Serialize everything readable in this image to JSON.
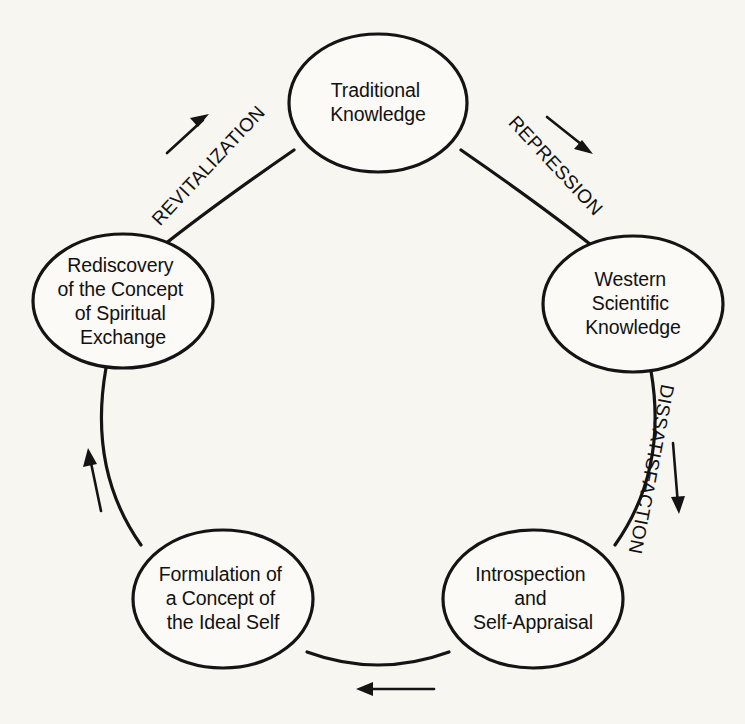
{
  "diagram": {
    "type": "cycle",
    "background_color": "#f7f6f1",
    "line_color": "#141414",
    "nodes": [
      {
        "id": "traditional-knowledge",
        "position": "top",
        "cx": 378,
        "cy": 103,
        "rx": 89,
        "ry": 69,
        "lines": [
          "Traditional",
          "Knowledge"
        ]
      },
      {
        "id": "western-scientific-knowledge",
        "position": "right",
        "cx": 633,
        "cy": 304,
        "rx": 90,
        "ry": 68,
        "lines": [
          "Western",
          "Scientific",
          "Knowledge"
        ]
      },
      {
        "id": "introspection-and-self-appraisal",
        "position": "bottom-right",
        "cx": 533,
        "cy": 599,
        "rx": 90,
        "ry": 69,
        "lines": [
          "Introspection",
          "and",
          "Self-Appraisal"
        ]
      },
      {
        "id": "formulation-of-a-concept-of-the-ideal-self",
        "position": "bottom-left",
        "cx": 223,
        "cy": 599,
        "rx": 90,
        "ry": 69,
        "lines": [
          "Formulation of",
          "a Concept of",
          "the Ideal Self"
        ]
      },
      {
        "id": "rediscovery-of-the-concept-of-spiritual-exchange",
        "position": "left",
        "cx": 123,
        "cy": 301,
        "rx": 90,
        "ry": 67,
        "lines": [
          "Rediscovery",
          "of the Concept",
          "of Spiritual",
          "Exchange"
        ]
      }
    ],
    "edges": [
      {
        "id": "repression",
        "label": "REPRESSION",
        "from": "traditional-knowledge",
        "to": "western-scientific-knowledge",
        "label_x": 551,
        "label_y": 170,
        "label_rotation": 47
      },
      {
        "id": "dissatisfaction",
        "label": "DISSATISFACTION",
        "from": "western-scientific-knowledge",
        "to": "introspection-and-self-appraisal",
        "label_x": 645,
        "label_y": 468,
        "label_rotation": 101
      },
      {
        "id": "unlabeled-bottom",
        "label": "",
        "from": "introspection-and-self-appraisal",
        "to": "formulation-of-a-concept-of-the-ideal-self"
      },
      {
        "id": "unlabeled-left",
        "label": "",
        "from": "formulation-of-a-concept-of-the-ideal-self",
        "to": "rediscovery-of-the-concept-of-spiritual-exchange"
      },
      {
        "id": "revitalization",
        "label": "REVITALIZATION",
        "from": "rediscovery-of-the-concept-of-spiritual-exchange",
        "to": "traditional-knowledge",
        "label_x": 213,
        "label_y": 170,
        "label_rotation": -47
      }
    ],
    "arrows": [
      {
        "id": "revitalization-arrow",
        "direction": "up-right",
        "x1": 167,
        "y1": 153,
        "x2": 207,
        "y2": 117
      },
      {
        "id": "repression-arrow",
        "direction": "down-right",
        "x1": 547,
        "y1": 117,
        "x2": 592,
        "y2": 153
      },
      {
        "id": "dissatisfaction-arrow",
        "direction": "down",
        "x1": 673,
        "y1": 443,
        "x2": 679,
        "y2": 512
      },
      {
        "id": "bottom-arrow",
        "direction": "left",
        "x1": 434,
        "y1": 689,
        "x2": 357,
        "y2": 689
      },
      {
        "id": "left-arrow",
        "direction": "up",
        "x1": 101,
        "y1": 511,
        "x2": 88,
        "y2": 449
      }
    ]
  }
}
